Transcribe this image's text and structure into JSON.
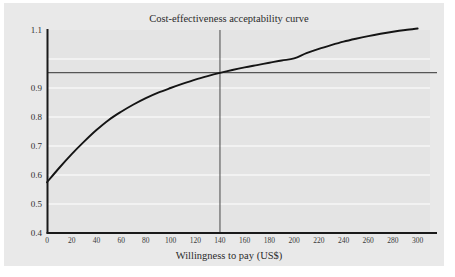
{
  "figure": {
    "background_color": "#ffffff",
    "panel_color": "#e9e9e9",
    "axis_color": "#1a1a1a",
    "grid_color": "#f7f7f7",
    "curve_color": "#141414",
    "reference_line_color": "#555555"
  },
  "chart_data": {
    "type": "line",
    "title": "Cost-effectiveness acceptability curve",
    "xlabel": "Willingness to pay (US$)",
    "ylabel": "",
    "xlim": [
      0,
      310
    ],
    "ylim": [
      0.4,
      1.1
    ],
    "grid": true,
    "legend": null,
    "xticks": [
      0,
      20,
      40,
      60,
      80,
      100,
      120,
      140,
      160,
      180,
      200,
      220,
      240,
      260,
      280,
      300
    ],
    "xtick_labels": [
      "0",
      "20",
      "40",
      "60",
      "80",
      "100",
      "120",
      "140",
      "160",
      "180",
      "200",
      "220",
      "240",
      "260",
      "280",
      "300"
    ],
    "yticks": [
      0.4,
      0.5,
      0.6,
      0.7,
      0.8,
      0.9,
      1.1
    ],
    "ytick_labels": [
      "0.4",
      "0.5",
      "0.6",
      "0.7",
      "0.8",
      "0.9",
      "1.1"
    ],
    "gridline_values": [
      0.5,
      0.6,
      0.7,
      0.8,
      0.9,
      1.0
    ],
    "series": [
      {
        "name": "Probability cost-effective",
        "x": [
          0,
          10,
          20,
          30,
          40,
          50,
          60,
          70,
          80,
          90,
          100,
          110,
          120,
          130,
          140,
          150,
          160,
          170,
          180,
          190,
          200,
          210,
          220,
          230,
          240,
          250,
          260,
          270,
          280,
          290,
          300
        ],
        "y": [
          0.575,
          0.625,
          0.672,
          0.715,
          0.755,
          0.79,
          0.818,
          0.843,
          0.865,
          0.884,
          0.9,
          0.915,
          0.929,
          0.941,
          0.952,
          0.962,
          0.971,
          0.979,
          0.987,
          0.995,
          1.002,
          1.02,
          1.035,
          1.048,
          1.06,
          1.07,
          1.079,
          1.087,
          1.094,
          1.1,
          1.105
        ]
      }
    ],
    "annotations": [
      {
        "type": "horizontal-reference-line",
        "name": "threshold-probability-line",
        "y": 0.953,
        "label": ""
      },
      {
        "type": "vertical-reference-line",
        "name": "threshold-willingness-to-pay-line",
        "x": 140,
        "label": ""
      }
    ]
  }
}
